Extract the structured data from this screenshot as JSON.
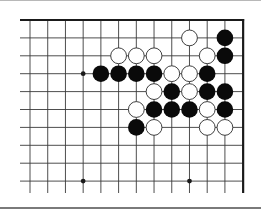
{
  "diagram": {
    "type": "go-board-fragment",
    "visible_columns": 13,
    "visible_rows": 10,
    "edges": {
      "top": true,
      "right": true,
      "left": false,
      "bottom": false
    },
    "colors": {
      "line": "#3a3a3a",
      "edge": "#1a1a1a",
      "black_stone": "#0a0a0a",
      "white_stone_fill": "#ffffff",
      "white_stone_stroke": "#2a2a2a",
      "rule_bottom": "#7a7a7a",
      "rule_top": "#b8b8b8"
    },
    "hoshi": [
      {
        "col": 3,
        "row": 3
      },
      {
        "col": 3,
        "row": 9
      },
      {
        "col": 9,
        "row": 9
      }
    ],
    "stones": [
      {
        "color": "white",
        "col": 9,
        "row": 1
      },
      {
        "color": "black",
        "col": 11,
        "row": 1
      },
      {
        "color": "white",
        "col": 5,
        "row": 2
      },
      {
        "color": "white",
        "col": 6,
        "row": 2
      },
      {
        "color": "white",
        "col": 7,
        "row": 2
      },
      {
        "color": "white",
        "col": 10,
        "row": 2
      },
      {
        "color": "black",
        "col": 11,
        "row": 2
      },
      {
        "color": "black",
        "col": 4,
        "row": 3
      },
      {
        "color": "black",
        "col": 5,
        "row": 3
      },
      {
        "color": "black",
        "col": 6,
        "row": 3
      },
      {
        "color": "black",
        "col": 7,
        "row": 3
      },
      {
        "color": "white",
        "col": 8,
        "row": 3
      },
      {
        "color": "white",
        "col": 9,
        "row": 3
      },
      {
        "color": "black",
        "col": 10,
        "row": 3
      },
      {
        "color": "white",
        "col": 7,
        "row": 4
      },
      {
        "color": "black",
        "col": 8,
        "row": 4
      },
      {
        "color": "white",
        "col": 9,
        "row": 4
      },
      {
        "color": "black",
        "col": 10,
        "row": 4
      },
      {
        "color": "black",
        "col": 11,
        "row": 4
      },
      {
        "color": "white",
        "col": 6,
        "row": 5
      },
      {
        "color": "black",
        "col": 7,
        "row": 5
      },
      {
        "color": "black",
        "col": 8,
        "row": 5
      },
      {
        "color": "black",
        "col": 9,
        "row": 5
      },
      {
        "color": "white",
        "col": 10,
        "row": 5
      },
      {
        "color": "black",
        "col": 11,
        "row": 5
      },
      {
        "color": "black",
        "col": 6,
        "row": 6
      },
      {
        "color": "white",
        "col": 7,
        "row": 6
      },
      {
        "color": "white",
        "col": 10,
        "row": 6
      },
      {
        "color": "white",
        "col": 11,
        "row": 6
      }
    ],
    "stone_counts": {
      "black": 15,
      "white": 14
    }
  }
}
